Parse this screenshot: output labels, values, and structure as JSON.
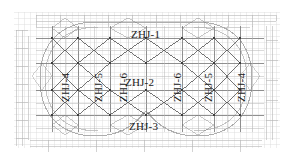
{
  "drawing": {
    "type": "structural-roof-truss-plan",
    "background_color": "#ffffff",
    "ink_color": "#1a1a1a",
    "grid_color": "#9a9a9a",
    "faint_grid_color": "#c9c9c9",
    "outline_color": "#b0b0b0",
    "labels": {
      "top": "ZHJ-1",
      "middle": "ZHJ-2",
      "bottom": "ZHJ-3",
      "left_outer": "ZHJ-4",
      "left_mid": "ZHJ-5",
      "left_inner": "ZHJ-6",
      "right_inner": "ZHJ-6",
      "right_mid": "ZHJ-5",
      "right_outer": "ZHJ-4"
    }
  }
}
